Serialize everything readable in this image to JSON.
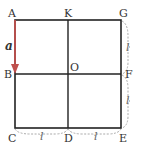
{
  "diagram": {
    "points": {
      "A": "A",
      "K": "K",
      "G": "G",
      "B": "B",
      "O": "O",
      "F": "F",
      "C": "C",
      "D": "D",
      "E": "E"
    },
    "vector_label": "a",
    "lengths": {
      "right_top": "l",
      "right_bottom": "l",
      "bottom_left": "l",
      "bottom_right": "l"
    },
    "colors": {
      "grid": "#222222",
      "vector": "#c0504d",
      "brace": "#aaaaaa"
    }
  }
}
